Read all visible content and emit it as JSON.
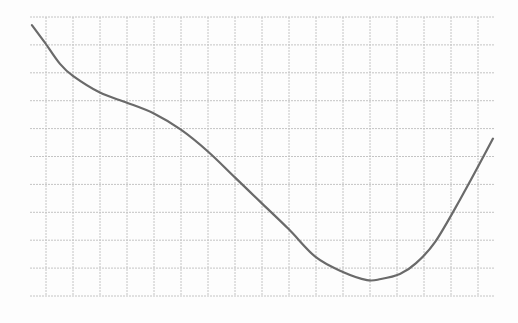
{
  "chart_data": {
    "type": "line",
    "title": "",
    "xlabel": "",
    "ylabel": "",
    "grid": true,
    "legend": null,
    "grid_cells": {
      "columns": 17,
      "rows": 10
    },
    "xlim": [
      0,
      17.2
    ],
    "ylim": [
      0,
      10
    ],
    "series": [
      {
        "name": "curve",
        "x": [
          0.07,
          0.56,
          1.11,
          1.59,
          2.59,
          3.59,
          4.59,
          5.59,
          6.59,
          7.59,
          8.59,
          9.59,
          10.59,
          11.59,
          12.48,
          13.0,
          13.7,
          14.3,
          15.0,
          15.93,
          17.15
        ],
        "y": [
          9.71,
          9.07,
          8.32,
          7.89,
          7.29,
          6.93,
          6.54,
          5.96,
          5.18,
          4.25,
          3.32,
          2.39,
          1.39,
          0.86,
          0.57,
          0.61,
          0.79,
          1.18,
          1.93,
          3.46,
          5.64
        ]
      }
    ],
    "annotations": [],
    "colors": {
      "curve": "#6a6a6a",
      "grid": "#c4c4c4",
      "background": "#fdfdfd"
    }
  }
}
